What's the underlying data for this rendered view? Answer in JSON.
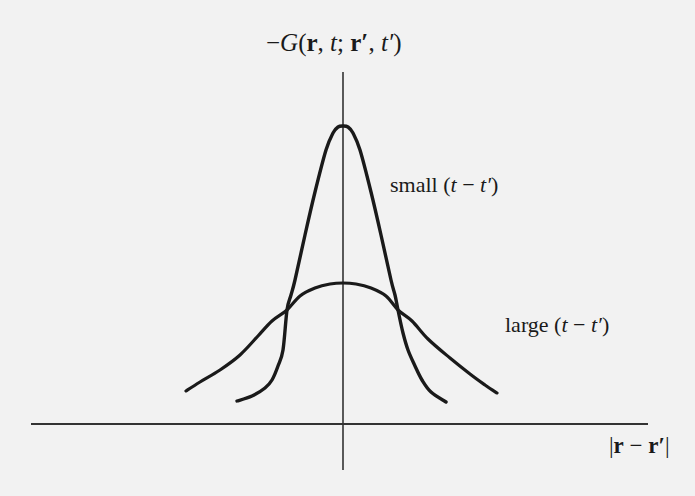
{
  "diagram": {
    "title": {
      "minus": "−",
      "G": "G",
      "open": "(",
      "r": "r",
      "c1": ", ",
      "t": "t",
      "semi": "; ",
      "rp": "r′",
      "c2": ", ",
      "tp": "t′",
      "close": ")"
    },
    "labels": {
      "small": {
        "word": "small",
        "open": " (",
        "t": "t",
        "minus": " − ",
        "tp": "t′",
        "close": ")"
      },
      "large": {
        "word": "large",
        "open": " (",
        "t": "t",
        "minus": " − ",
        "tp": "t′",
        "close": ")"
      },
      "xaxis": {
        "bar1": "|",
        "r": "r",
        "minus": " − ",
        "rp": "r′",
        "bar2": "|"
      }
    },
    "colors": {
      "background": "#f2f2f2",
      "curve": "#1a1a1a",
      "axis": "#333333"
    }
  },
  "chart_data": {
    "type": "line",
    "title": "−G(r, t; r′, t′)",
    "xlabel": "|r − r′|",
    "ylabel": "−G(r, t; r′, t′)",
    "axes": {
      "x_axis": {
        "x1": 31,
        "x2": 648,
        "y": 424
      },
      "y_axis": {
        "x": 343,
        "y1": 72,
        "y2": 470
      },
      "grid": false,
      "ticks": false
    },
    "series": [
      {
        "name": "small (t − t′)",
        "description": "narrow, tall bell curve",
        "pixel_points": [
          [
            237,
            401
          ],
          [
            252,
            396
          ],
          [
            265,
            388
          ],
          [
            272,
            380
          ],
          [
            278,
            366
          ],
          [
            283,
            350
          ],
          [
            287,
            310
          ],
          [
            291,
            295
          ],
          [
            295,
            280
          ],
          [
            305,
            235
          ],
          [
            315,
            192
          ],
          [
            326,
            150
          ],
          [
            333,
            133
          ],
          [
            338,
            127
          ],
          [
            343,
            126
          ],
          [
            348,
            127
          ],
          [
            353,
            133
          ],
          [
            360,
            150
          ],
          [
            371,
            192
          ],
          [
            381,
            235
          ],
          [
            391,
            280
          ],
          [
            395,
            295
          ],
          [
            398,
            310
          ],
          [
            403,
            333
          ],
          [
            408,
            350
          ],
          [
            415,
            366
          ],
          [
            422,
            380
          ],
          [
            431,
            392
          ],
          [
            446,
            402
          ]
        ]
      },
      {
        "name": "large (t − t′)",
        "description": "wide, low bell curve",
        "pixel_points": [
          [
            186,
            391
          ],
          [
            200,
            382
          ],
          [
            220,
            370
          ],
          [
            240,
            355
          ],
          [
            258,
            336
          ],
          [
            272,
            321
          ],
          [
            287,
            310
          ],
          [
            300,
            296
          ],
          [
            315,
            288
          ],
          [
            330,
            284
          ],
          [
            343,
            283
          ],
          [
            356,
            284
          ],
          [
            371,
            288
          ],
          [
            386,
            296
          ],
          [
            398,
            310
          ],
          [
            412,
            321
          ],
          [
            428,
            339
          ],
          [
            450,
            358
          ],
          [
            470,
            374
          ],
          [
            485,
            385
          ],
          [
            497,
            393
          ]
        ]
      }
    ],
    "annotations": [
      {
        "text": "small (t − t′)",
        "x": 390,
        "y": 193
      },
      {
        "text": "large (t − t′)",
        "x": 505,
        "y": 333
      }
    ]
  }
}
